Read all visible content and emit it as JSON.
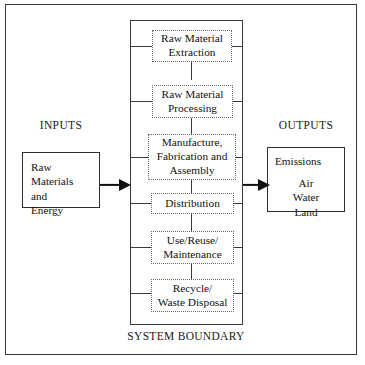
{
  "diagram": {
    "boundary_caption": "SYSTEM BOUNDARY",
    "colors": {
      "frame": "#3a3a3a",
      "boundary": "#3b3b3b",
      "process_border": "#6a6a6a",
      "io_border": "#2e2e2e",
      "arrow": "#111111",
      "text": "#111111",
      "background": "#ffffff"
    }
  },
  "inputs": {
    "label": "INPUTS",
    "box_lines": "Raw\nMaterials\nand\nEnergy",
    "line1": "Raw",
    "line2": "Materials",
    "line3": "and",
    "line4": "Energy",
    "arrow_direction": "right"
  },
  "outputs": {
    "label": "OUTPUTS",
    "heading": "Emissions",
    "items": [
      "Air",
      "Water",
      "Land"
    ],
    "item1": "Air",
    "item2": "Water",
    "item3": "Land",
    "arrow_direction": "right"
  },
  "stages": [
    {
      "id": "raw-material-extraction",
      "line1": "Raw Material",
      "line2": "Extraction",
      "label": "Raw Material Extraction"
    },
    {
      "id": "raw-material-processing",
      "line1": "Raw Material",
      "line2": "Processing",
      "label": "Raw Material Processing"
    },
    {
      "id": "manufacture-fabrication-assembly",
      "line1": "Manufacture,",
      "line2": "Fabrication and",
      "line3": "Assembly",
      "label": "Manufacture, Fabrication and Assembly"
    },
    {
      "id": "distribution",
      "line1": "Distribution",
      "label": "Distribution"
    },
    {
      "id": "use-reuse-maintenance",
      "line1": "Use/Reuse/",
      "line2": "Maintenance",
      "label": "Use/Reuse/ Maintenance"
    },
    {
      "id": "recycle-waste-disposal",
      "line1": "Recycle/",
      "line2": "Waste Disposal",
      "label": "Recycle/ Waste Disposal"
    }
  ]
}
